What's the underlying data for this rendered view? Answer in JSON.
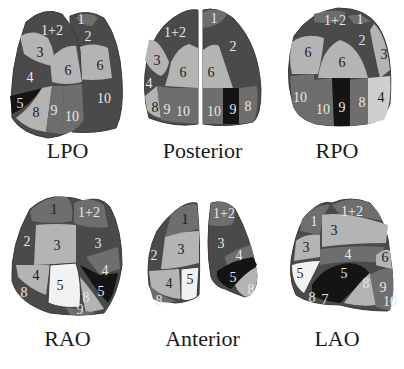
{
  "palette": {
    "dark": "#4a4a4a",
    "mid": "#6e6e6e",
    "light": "#b4b4b4",
    "lighter": "#cfcfcf",
    "white": "#f2f2f2",
    "black": "#141414",
    "outline": "#3a3a3a"
  },
  "views": [
    {
      "id": "lpo",
      "caption": "LPO",
      "segments": [
        "1+2",
        "1",
        "2",
        "3",
        "6",
        "6",
        "4",
        "5",
        "8",
        "9",
        "10",
        "10"
      ]
    },
    {
      "id": "posterior",
      "caption": "Posterior",
      "segments": [
        "1+2",
        "1",
        "2",
        "3",
        "6",
        "6",
        "4",
        "8",
        "9",
        "10",
        "10",
        "9",
        "8"
      ]
    },
    {
      "id": "rpo",
      "caption": "RPO",
      "segments": [
        "1+2",
        "1",
        "2",
        "6",
        "6",
        "3",
        "10",
        "10",
        "9",
        "8",
        "4"
      ]
    },
    {
      "id": "rao",
      "caption": "RAO",
      "segments": [
        "1",
        "1+2",
        "2",
        "3",
        "3",
        "4",
        "4",
        "5",
        "8",
        "5",
        "8",
        "9"
      ]
    },
    {
      "id": "anterior",
      "caption": "Anterior",
      "segments": [
        "1",
        "1+2",
        "2",
        "3",
        "3",
        "4",
        "4",
        "5",
        "5",
        "8",
        "8"
      ]
    },
    {
      "id": "lao",
      "caption": "LAO",
      "segments": [
        "1",
        "1+2",
        "3",
        "3",
        "4",
        "6",
        "5",
        "5",
        "8",
        "9",
        "8",
        "7",
        "10"
      ]
    }
  ]
}
